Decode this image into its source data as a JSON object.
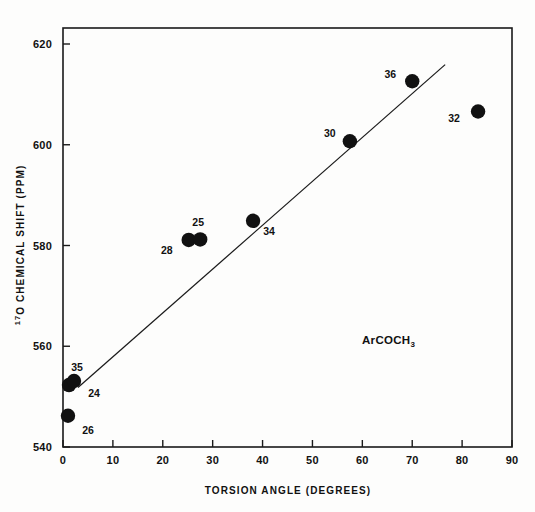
{
  "figure": {
    "annotation": "ArCOCH",
    "annotation_subscript": "3",
    "background_color": "#fdfdfc",
    "marker_color": "#111111",
    "line_color": "#1a1a1a"
  },
  "chart_data": {
    "type": "scatter",
    "title": "",
    "xlabel": "TORSION ANGLE (DEGREES)",
    "ylabel_superscript": "17",
    "ylabel": "O CHEMICAL SHIFT (PPM)",
    "ylabel_full": "17O CHEMICAL SHIFT (PPM)",
    "xlim": [
      0,
      90
    ],
    "ylim": [
      540,
      620
    ],
    "xticks": [
      0,
      10,
      20,
      30,
      40,
      50,
      60,
      70,
      80,
      90
    ],
    "yticks": [
      540,
      560,
      580,
      600,
      620
    ],
    "xtick_labels": [
      "0",
      "10",
      "20",
      "30",
      "40",
      "50",
      "60",
      "70",
      "80",
      "90"
    ],
    "ytick_labels": [
      "540",
      "560",
      "580",
      "600",
      "620"
    ],
    "grid": false,
    "legend": "none",
    "annotations": [
      "ArCOCH3"
    ],
    "points": [
      {
        "label": "26",
        "x": 1.0,
        "y": 546.2,
        "label_dx": 20,
        "label_dy": 18
      },
      {
        "label": "35",
        "x": 1.2,
        "y": 552.3,
        "label_dx": 8,
        "label_dy": -14
      },
      {
        "label": "24",
        "x": 2.2,
        "y": 553.1,
        "label_dx": 20,
        "label_dy": 16
      },
      {
        "label": "28",
        "x": 25.2,
        "y": 581.1,
        "label_dx": -22,
        "label_dy": 14
      },
      {
        "label": "25",
        "x": 27.5,
        "y": 581.2,
        "label_dx": -2,
        "label_dy": -13
      },
      {
        "label": "34",
        "x": 38.1,
        "y": 584.9,
        "label_dx": 16,
        "label_dy": 14
      },
      {
        "label": "30",
        "x": 57.5,
        "y": 600.7,
        "label_dx": -20,
        "label_dy": -4
      },
      {
        "label": "36",
        "x": 70.0,
        "y": 612.6,
        "label_dx": -22,
        "label_dy": -3
      },
      {
        "label": "32",
        "x": 83.2,
        "y": 606.6,
        "label_dx": -24,
        "label_dy": 10
      }
    ],
    "fit_line": {
      "x_start": 3.0,
      "y_start": 551.8,
      "x_end": 76.6,
      "y_end": 615.9
    }
  }
}
